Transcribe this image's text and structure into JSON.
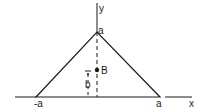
{
  "diagram": {
    "type": "geometry-figure",
    "colors": {
      "stroke": "#1a1a1a",
      "background": "#ffffff"
    },
    "axes": {
      "x_label": "x",
      "y_label": "y"
    },
    "vertices": {
      "apex_label": "a",
      "left_label": "-a",
      "right_label": "a"
    },
    "point": {
      "label": "B",
      "height_label": "b"
    }
  }
}
